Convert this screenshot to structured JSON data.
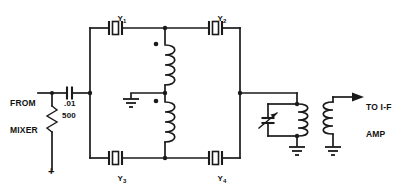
{
  "diagram": {
    "background_color": "#ffffff",
    "line_color": "#1a1a1a"
  },
  "labels": {
    "input_line1": "FROM",
    "input_line2": "MIXER",
    "output_line1": "TO I-F",
    "output_line2": "AMP",
    "capacitor_value": ".01",
    "resistor_value": "500",
    "supply_marker": "+"
  },
  "crystals": [
    {
      "name": "Y1",
      "base": "Y",
      "sub": "1",
      "position": "top-left"
    },
    {
      "name": "Y2",
      "base": "Y",
      "sub": "2",
      "position": "top-right"
    },
    {
      "name": "Y3",
      "base": "Y",
      "sub": "3",
      "position": "bottom-left"
    },
    {
      "name": "Y4",
      "base": "Y",
      "sub": "4",
      "position": "bottom-right"
    }
  ],
  "components": [
    {
      "type": "capacitor",
      "name": "input-coupling-capacitor",
      "value": ".01"
    },
    {
      "type": "resistor",
      "name": "input-load-resistor",
      "value": "500"
    },
    {
      "type": "crystal",
      "name": "crystal-y1",
      "value": "Y1"
    },
    {
      "type": "crystal",
      "name": "crystal-y2",
      "value": "Y2"
    },
    {
      "type": "crystal",
      "name": "crystal-y3",
      "value": "Y3"
    },
    {
      "type": "crystal",
      "name": "crystal-y4",
      "value": "Y4"
    },
    {
      "type": "inductor",
      "name": "input-transformer-upper-winding",
      "value": ""
    },
    {
      "type": "inductor",
      "name": "input-transformer-lower-winding",
      "value": ""
    },
    {
      "type": "variable-capacitor",
      "name": "tank-tuning-capacitor",
      "value": ""
    },
    {
      "type": "inductor",
      "name": "output-transformer-primary",
      "value": ""
    },
    {
      "type": "inductor",
      "name": "output-transformer-secondary",
      "value": ""
    },
    {
      "type": "ground",
      "name": "center-tap-ground",
      "value": ""
    },
    {
      "type": "ground",
      "name": "tank-ground",
      "value": ""
    },
    {
      "type": "ground",
      "name": "secondary-ground",
      "value": ""
    }
  ]
}
